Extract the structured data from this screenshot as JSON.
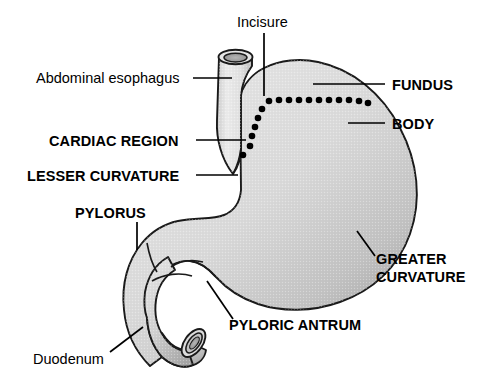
{
  "figure": {
    "background_color": "#ffffff",
    "line_color": "#000000",
    "organ_fill_light": "#e2e2e2",
    "organ_fill_mid": "#cfcfcf",
    "organ_fill_dark": "#a6a6a6"
  },
  "labels": {
    "incisure": "Incisure",
    "abdominal_esophagus": "Abdominal esophagus",
    "cardiac_region": "CARDIAC REGION",
    "lesser_curvature": "LESSER CURVATURE",
    "pylorus": "PYLORUS",
    "duodenum": "Duodenum",
    "pyloric_antrum": "PYLORIC ANTRUM",
    "fundus": "FUNDUS",
    "body": "BODY",
    "greater_curvature_line1": "GREATER",
    "greater_curvature_line2": "CURVATURE"
  },
  "parts": {
    "esophagus": "abdominal-esophagus",
    "fundus": "fundus",
    "body": "body",
    "cardia": "cardiac-region",
    "lesser_curvature": "lesser-curvature",
    "greater_curvature": "greater-curvature",
    "pyloric_antrum": "pyloric-antrum",
    "pylorus": "pylorus",
    "duodenum": "duodenum",
    "incisure": "incisure-angularis"
  }
}
